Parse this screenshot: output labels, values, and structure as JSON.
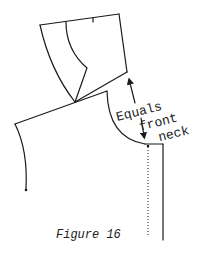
{
  "figure": {
    "caption": "Figure 16",
    "annotation": {
      "line1": "Equals",
      "line2": "front",
      "line3": "neck"
    }
  },
  "colors": {
    "ink": "#1a1a1a",
    "background": "#ffffff"
  }
}
